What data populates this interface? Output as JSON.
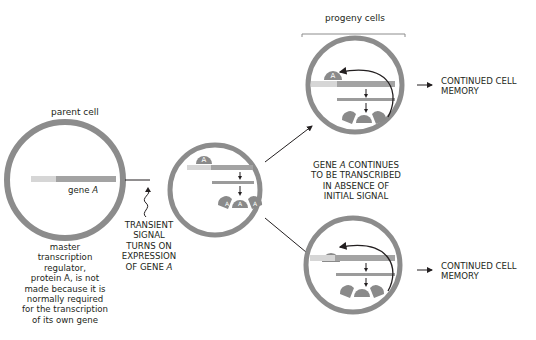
{
  "labels": {
    "parent_cell": "parent cell",
    "gene": "gene",
    "gene_italic": "A",
    "progeny_cells": "progeny cells",
    "master_note_lines": [
      "master",
      "transcription",
      "regulator,",
      "protein A, is not",
      "made because it is",
      "normally required",
      "for the transcription",
      "of its own gene"
    ],
    "signal_lines": [
      "TRANSIENT",
      "SIGNAL",
      "TURNS ON",
      "EXPRESSION",
      "OF GENE"
    ],
    "signal_italic": "A",
    "continues_lines": [
      "GENE",
      "CONTINUES",
      "TO BE TRANSCRIBED",
      "IN ABSENCE OF",
      "INITIAL SIGNAL"
    ],
    "continues_italic": "A",
    "memory_top_line1": "CONTINUED CELL",
    "memory_top_line2": "MEMORY",
    "memory_bottom_line1": "CONTINUED CELL",
    "memory_bottom_line2": "MEMORY",
    "protein_letter": "A"
  },
  "colors": {
    "cell_ring": "#8c8c8c",
    "cell_fill": "#ffffff",
    "gene_light": "#d6d6d6",
    "gene_dark": "#a3a3a3",
    "rna": "#9b9b9b",
    "protein": "#8a8a8a",
    "text": "#231f20"
  }
}
